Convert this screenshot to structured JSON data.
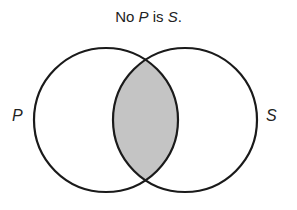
{
  "title": {
    "prefix": "No ",
    "p": "P",
    "mid": " is ",
    "s": "S",
    "suffix": "."
  },
  "labels": {
    "left": "P",
    "right": "S"
  },
  "colors": {
    "stroke": "#1a1a1a",
    "shade": "#c4c4c4",
    "background": "#ffffff"
  },
  "diagram": {
    "type": "venn",
    "sets": [
      "P",
      "S"
    ],
    "shaded_region": "P∩S",
    "meaning": "intersection is empty"
  }
}
